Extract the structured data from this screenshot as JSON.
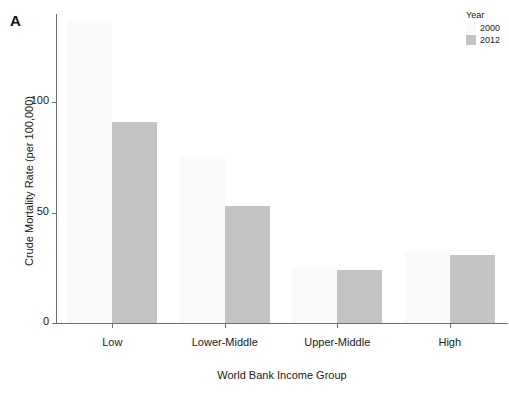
{
  "panel": {
    "label": "A"
  },
  "legend": {
    "title": "Year",
    "position": "top-right",
    "entries": [
      {
        "label": "2000",
        "color": "#fafafa"
      },
      {
        "label": "2012",
        "color": "#c4c4c4"
      }
    ]
  },
  "chart_data": {
    "type": "bar",
    "title": "",
    "subtitle": "",
    "xlabel": "World Bank Income Group",
    "ylabel": "Crude Mortality Rate (per 100,000)",
    "categories": [
      "Low",
      "Lower-Middle",
      "Upper-Middle",
      "High"
    ],
    "series": [
      {
        "name": "2000",
        "color": "#fafafa",
        "values": [
          137,
          75,
          25,
          32
        ]
      },
      {
        "name": "2012",
        "color": "#c4c4c4",
        "values": [
          91,
          53,
          24,
          31
        ]
      }
    ],
    "ylim": [
      0,
      140
    ],
    "yticks": [
      0,
      50,
      100
    ],
    "ytick_labels": [
      "0",
      "50",
      "100"
    ],
    "grid": false,
    "legend_title": "Year",
    "annotations": [
      "A"
    ]
  }
}
